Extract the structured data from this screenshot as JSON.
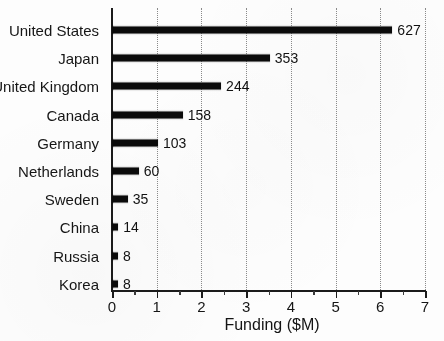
{
  "chart_data": {
    "type": "bar",
    "orientation": "horizontal",
    "title": "",
    "xlabel": "Funding ($M)",
    "ylabel": "",
    "categories": [
      "United States",
      "Japan",
      "United Kingdom",
      "Canada",
      "Germany",
      "Netherlands",
      "Sweden",
      "China",
      "Russia",
      "Korea"
    ],
    "values": [
      627,
      353,
      244,
      158,
      103,
      60,
      35,
      14,
      8,
      8
    ],
    "value_labels": [
      "627",
      "353",
      "244",
      "158",
      "103",
      "60",
      "35",
      "14",
      "8",
      "8"
    ],
    "xlim": [
      0,
      7.3
    ],
    "xtick_values": [
      0,
      1,
      2,
      3,
      4,
      5,
      6,
      7
    ],
    "xtick_labels": [
      "0",
      "1",
      "2",
      "3",
      "4",
      "5",
      "6",
      "7"
    ],
    "x_axis_units": "hundreds of $M",
    "grid": true,
    "grid_axis": "x",
    "grid_style": "dotted",
    "legend": false,
    "bar_color": "#0b0b0b",
    "background_color": "#fdfdfd",
    "axis_color": "#1b1b1b",
    "grid_color": "#8a8a8a"
  }
}
